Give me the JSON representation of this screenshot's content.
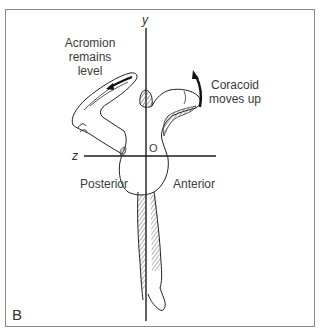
{
  "figure": {
    "panel_label": "B",
    "axes": {
      "y_label": "y",
      "z_label": "z",
      "origin_label": "O"
    },
    "annotations": {
      "acromion": [
        "Acromion",
        "remains",
        "level"
      ],
      "coracoid": [
        "Coracoid",
        "moves up"
      ],
      "posterior": "Posterior",
      "anterior": "Anterior"
    },
    "colors": {
      "line": "#1a1a1a",
      "text": "#3a3a3a",
      "frame": "#8a8a8a",
      "hatch": "#555555"
    }
  }
}
